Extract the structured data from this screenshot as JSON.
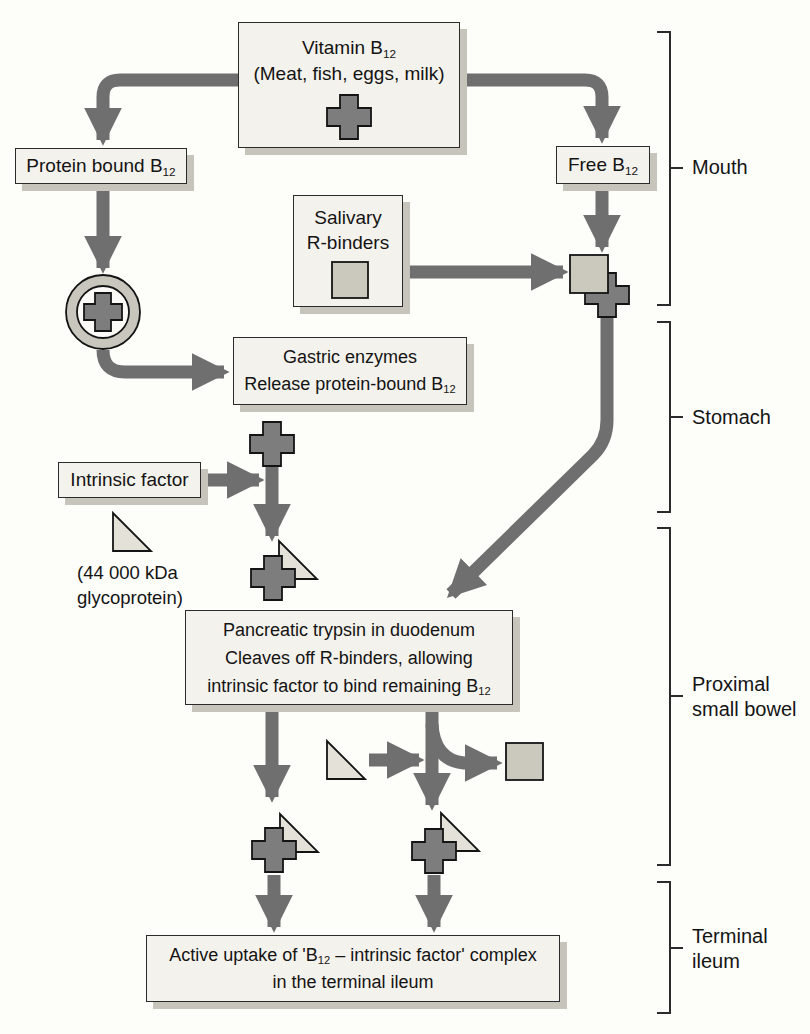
{
  "colors": {
    "background": "#fdfdfa",
    "box_bg": "#f4f2ec",
    "box_border": "#2b2b2b",
    "box_shadow": "#c7c4bc",
    "arrow": "#6f6f6f",
    "cross_fill": "#7d7d7d",
    "square_fill": "#cbc8bd",
    "triangle_fill": "#e4e1d8",
    "ring_fill": "#c9c6bd",
    "ring_inner": "#fbfaf6",
    "outline": "#141414",
    "bracket": "#2b2b2b",
    "text": "#141414"
  },
  "boxes": {
    "vitamin": {
      "title": "Vitamin B",
      "title_sub": "12",
      "subtitle": "(Meat, fish, eggs, milk)"
    },
    "protein_bound": {
      "text": "Protein bound B",
      "sub": "12"
    },
    "free_b12": {
      "text": "Free B",
      "sub": "12"
    },
    "salivary": {
      "line1": "Salivary",
      "line2": "R-binders"
    },
    "gastric": {
      "line1": "Gastric enzymes",
      "line2": "Release protein-bound B",
      "line2_sub": "12"
    },
    "intrinsic": {
      "text": "Intrinsic factor"
    },
    "pancreatic": {
      "line1": "Pancreatic trypsin in duodenum",
      "line2": "Cleaves off R-binders, allowing",
      "line3": "intrinsic factor to bind remaining B",
      "line3_sub": "12"
    },
    "active_uptake": {
      "line1_a": "Active uptake of 'B",
      "line1_sub": "12",
      "line1_b": " – intrinsic factor' complex",
      "line2": "in the terminal ileum"
    }
  },
  "notes": {
    "kda": {
      "line1": "(44 000 kDa",
      "line2": "glycoprotein)"
    }
  },
  "regions": {
    "mouth": {
      "line1": "Mouth"
    },
    "stomach": {
      "line1": "Stomach"
    },
    "proximal": {
      "line1": "Proximal",
      "line2": "small bowel"
    },
    "terminal": {
      "line1": "Terminal",
      "line2": "ileum"
    }
  }
}
